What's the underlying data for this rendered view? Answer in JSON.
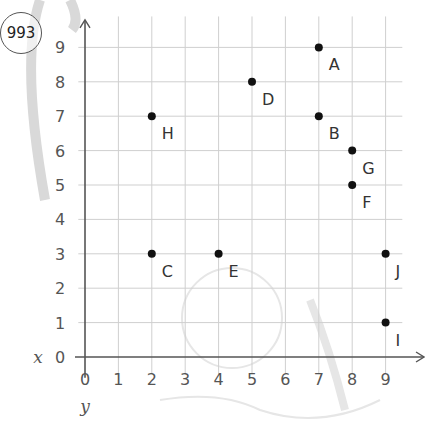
{
  "badge": {
    "number": "993"
  },
  "chart_data": {
    "type": "scatter",
    "title": "",
    "xlabel": "x",
    "ylabel": "y",
    "xlim": [
      0,
      9
    ],
    "ylim": [
      0,
      9
    ],
    "grid": true,
    "x_ticks": [
      "0",
      "1",
      "2",
      "3",
      "4",
      "5",
      "6",
      "7",
      "8",
      "9"
    ],
    "y_ticks": [
      "0",
      "1",
      "2",
      "3",
      "4",
      "5",
      "6",
      "7",
      "8",
      "9"
    ],
    "points": [
      {
        "label": "A",
        "x": 7,
        "y": 9
      },
      {
        "label": "B",
        "x": 7,
        "y": 7
      },
      {
        "label": "C",
        "x": 2,
        "y": 3
      },
      {
        "label": "D",
        "x": 5,
        "y": 8
      },
      {
        "label": "E",
        "x": 4,
        "y": 3
      },
      {
        "label": "F",
        "x": 8,
        "y": 5
      },
      {
        "label": "G",
        "x": 8,
        "y": 6
      },
      {
        "label": "H",
        "x": 2,
        "y": 7
      },
      {
        "label": "I",
        "x": 9,
        "y": 1
      },
      {
        "label": "J",
        "x": 9,
        "y": 3
      }
    ]
  },
  "colors": {
    "grid": "#cfcfcf",
    "axis": "#555555",
    "point": "#111111",
    "text": "#333333",
    "decoration": "#e6e6e6"
  }
}
